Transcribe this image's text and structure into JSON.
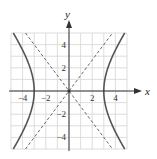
{
  "figure": {
    "title": "",
    "axes": {
      "x_label": "x",
      "y_label": "y",
      "x_range": [
        -5,
        5
      ],
      "y_range": [
        -5,
        5
      ],
      "grid_step": 1,
      "x_ticks": [
        {
          "value": -4,
          "label": "−4"
        },
        {
          "value": -2,
          "label": "−2"
        },
        {
          "value": 2,
          "label": "2"
        },
        {
          "value": 4,
          "label": "4"
        }
      ],
      "y_ticks": [
        {
          "value": 4,
          "label": "4"
        },
        {
          "value": 2,
          "label": "2"
        },
        {
          "value": -2,
          "label": "−2"
        },
        {
          "value": -4,
          "label": "−4"
        }
      ]
    },
    "curve": {
      "type": "hyperbola",
      "a": 3,
      "b": 4,
      "vertices": [
        [
          -3,
          0
        ],
        [
          3,
          0
        ]
      ],
      "center": [
        0,
        0
      ]
    },
    "asymptotes": [
      {
        "slope": 1.3333,
        "style": "dashed"
      },
      {
        "slope": -1.3333,
        "style": "dashed"
      }
    ],
    "colors": {
      "grid": "#d4d4d4",
      "axis": "#333333",
      "curve": "#555555",
      "asymptote": "#555555"
    }
  }
}
